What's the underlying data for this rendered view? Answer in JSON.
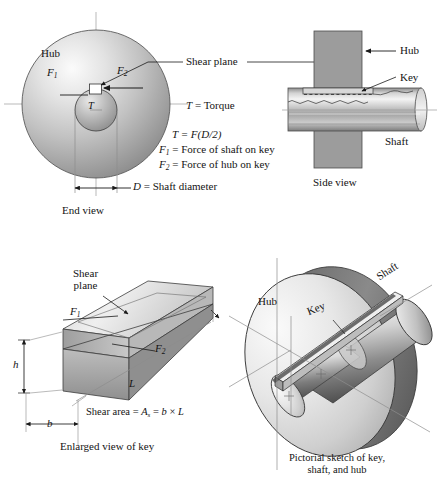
{
  "figure": {
    "background": "#ffffff",
    "line_color": "#1a1a1a"
  },
  "end_view": {
    "caption": "End view",
    "hub_label": "Hub",
    "force1_label": "F",
    "force1_sub": "1",
    "force2_label": "F",
    "force2_sub": "2",
    "torque_label": "T",
    "diameter_note_var": "D",
    "diameter_note_text": " = Shaft diameter",
    "colors": {
      "hub_light": "#f2f2f2",
      "hub_mid": "#b9b9b9",
      "hub_dark": "#8e8e8e"
    }
  },
  "equations": {
    "torque_def_var": "T",
    "torque_def_text": " = Torque",
    "torque_formula_lhs": "T",
    "torque_formula_rhs": " = F(D/2)",
    "f1_var": "F",
    "f1_sub": "1",
    "f1_text": " = Force of shaft on key",
    "f2_var": "F",
    "f2_sub": "2",
    "f2_text": " = Force of hub on key"
  },
  "shear_plane_callout": {
    "label": "Shear plane"
  },
  "side_view": {
    "caption": "Side view",
    "hub_label": "Hub",
    "key_label": "Key",
    "shaft_label": "Shaft",
    "colors": {
      "hub_fill": "#9a9a9a",
      "shaft_light": "#ededed",
      "shaft_mid": "#b0b0b0",
      "shaft_dark": "#6f6f6f"
    }
  },
  "enlarged_key": {
    "caption": "Enlarged view of key",
    "shear_plane_line1": "Shear",
    "shear_plane_line2": "plane",
    "force1_label": "F",
    "force1_sub": "1",
    "force2_label": "F",
    "force2_sub": "2",
    "height_label": "h",
    "width_label": "b",
    "length_label": "L",
    "area_text_1": "Shear area = ",
    "area_var_A": "A",
    "area_sub_s": "s",
    "area_text_2": " = ",
    "area_var_b": "b",
    "area_times": " × ",
    "area_var_L": "L",
    "colors": {
      "top_light": "#e8e8e8",
      "top_mid": "#c9c9c9",
      "side_dark": "#a2a2a2"
    }
  },
  "pictorial": {
    "caption_line1": "Pictorial sketch of key,",
    "caption_line2": "shaft, and hub",
    "hub_label": "Hub",
    "key_label": "Key",
    "shaft_label": "Shaft",
    "colors": {
      "hub_face": "#e6e6e6",
      "hub_rim": "#767676",
      "shaft_light": "#f0f0f0",
      "shaft_dark": "#5a5a5a"
    }
  }
}
